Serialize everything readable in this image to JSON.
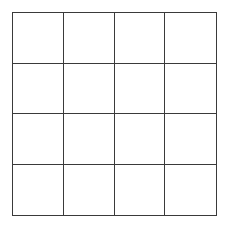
{
  "grid": {
    "rows": 4,
    "columns": 4,
    "line_color": "#3a3a3a",
    "background_color": "#ffffff",
    "cells": [
      [
        "",
        "",
        "",
        ""
      ],
      [
        "",
        "",
        "",
        ""
      ],
      [
        "",
        "",
        "",
        ""
      ],
      [
        "",
        "",
        "",
        ""
      ]
    ]
  }
}
